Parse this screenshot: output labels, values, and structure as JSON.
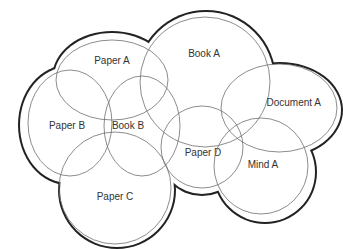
{
  "diagram": {
    "type": "euler-cloud",
    "colors": {
      "outline": "#222222",
      "circle_stroke": "#6e6e6e",
      "label": "#333333",
      "background": "#ffffff"
    },
    "regions": [
      {
        "id": "paper-a",
        "label": "Paper A",
        "cx": 112,
        "cy": 80,
        "rx": 56,
        "ry": 42,
        "label_x": 112,
        "label_y": 64
      },
      {
        "id": "book-a",
        "label": "Book A",
        "cx": 205,
        "cy": 80,
        "rx": 66,
        "ry": 66,
        "label_x": 204,
        "label_y": 57
      },
      {
        "id": "paper-b",
        "label": "Paper B",
        "cx": 70,
        "cy": 125,
        "rx": 42,
        "ry": 55,
        "label_x": 67,
        "label_y": 129
      },
      {
        "id": "book-b",
        "label": "Book B",
        "cx": 140,
        "cy": 128,
        "rx": 40,
        "ry": 50,
        "label_x": 128,
        "label_y": 129
      },
      {
        "id": "paper-c",
        "label": "Paper C",
        "cx": 115,
        "cy": 190,
        "rx": 57,
        "ry": 57,
        "label_x": 115,
        "label_y": 200
      },
      {
        "id": "paper-d",
        "label": "Paper D",
        "cx": 202,
        "cy": 150,
        "rx": 41,
        "ry": 41,
        "label_x": 203,
        "label_y": 156
      },
      {
        "id": "document-a",
        "label": "Document A",
        "cx": 278,
        "cy": 110,
        "rx": 60,
        "ry": 44,
        "label_x": 321,
        "label_y": 106
      },
      {
        "id": "mind-a",
        "label": "Mind A",
        "cx": 263,
        "cy": 170,
        "rx": 50,
        "ry": 47,
        "label_x": 263,
        "label_y": 168
      }
    ]
  }
}
